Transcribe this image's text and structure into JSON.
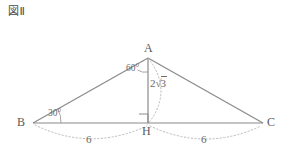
{
  "figure": {
    "title": "図Ⅱ",
    "caption_label": "図Ⅱ"
  },
  "colors": {
    "stroke": "#8a8a8a",
    "dotted": "#b0b0b0",
    "text": "#5a5a5a",
    "background": "#ffffff"
  },
  "geometry": {
    "type": "triangle-with-altitude",
    "vertices": [
      {
        "name": "A",
        "label": "A",
        "x": 148,
        "y": 58
      },
      {
        "name": "B",
        "label": "B",
        "x": 33,
        "y": 123
      },
      {
        "name": "C",
        "label": "C",
        "x": 263,
        "y": 123
      },
      {
        "name": "H",
        "label": "H",
        "x": 148,
        "y": 123
      }
    ],
    "edges": [
      {
        "name": "AB",
        "from": "A",
        "to": "B"
      },
      {
        "name": "AC",
        "from": "A",
        "to": "C"
      },
      {
        "name": "BC",
        "from": "B",
        "to": "C"
      },
      {
        "name": "AH",
        "from": "A",
        "to": "H"
      }
    ]
  },
  "labels": {
    "vertex_a": "A",
    "vertex_b": "B",
    "vertex_c": "C",
    "vertex_h": "H",
    "angle_at_a": "60°",
    "angle_at_b": "30°",
    "altitude_coefficient": "2",
    "altitude_radical": "3",
    "altitude_full": "2√3",
    "segment_bh": "6",
    "segment_hc": "6"
  },
  "markers": {
    "right_angle_at_h": true,
    "arc_angle_a": true,
    "arc_angle_b": true,
    "dotted_arc_altitude": true,
    "dotted_arc_bh": true,
    "dotted_arc_hc": true
  }
}
